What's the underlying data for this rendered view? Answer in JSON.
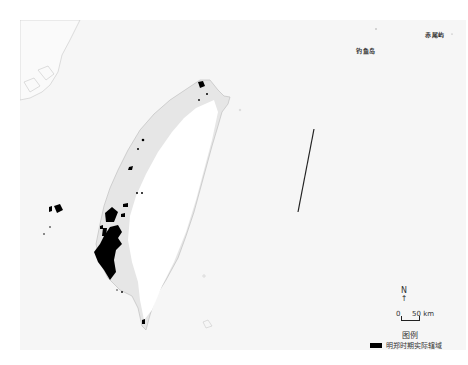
{
  "map": {
    "title": "",
    "labels": {
      "chiwei_island": "赤尾屿",
      "diaoyu_island": "钓鱼岛"
    },
    "north_arrow": {
      "letter": "N",
      "arrow": "↑"
    },
    "scale_bar": {
      "start": "0",
      "end": "50 km"
    },
    "legend": {
      "title": "图例",
      "items": [
        {
          "label": "明郑时期实际辖域",
          "color": "#000000"
        }
      ]
    },
    "colors": {
      "sea": "#f6f6f6",
      "land_lowland": "#e6e6e6",
      "land_highland": "#ffffff",
      "territory": "#000000",
      "boundary_line": "#222222"
    }
  }
}
